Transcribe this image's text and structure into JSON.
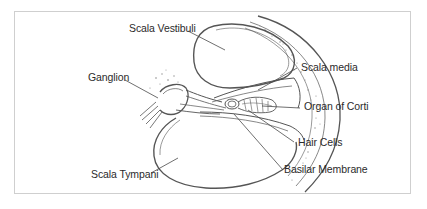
{
  "figure": {
    "labels": {
      "scala_vestibuli": "Scala Vestibuli",
      "ganglion": "Ganglion",
      "scala_media": "Scala media",
      "organ_of_corti": "Organ of Corti",
      "hair_cells": "Hair Cells",
      "basilar_membrane": "Basilar Membrane",
      "scala_tympani": "Scala Tympani"
    },
    "colors": {
      "line": "#555555",
      "text": "#2b2b2b",
      "frame": "#cfcfcf",
      "background": "#ffffff"
    }
  }
}
